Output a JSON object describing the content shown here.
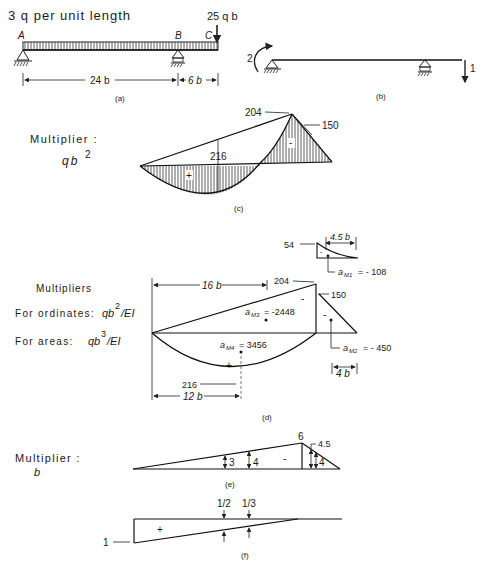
{
  "panel_a": {
    "load_label": "3 q per unit length",
    "point_load": "25 q b",
    "point_A": "A",
    "point_B": "B",
    "point_C": "C",
    "span_AB": "24 b",
    "span_BC": "6 b",
    "caption": "(a)"
  },
  "panel_b": {
    "moment_value": "2",
    "force_value": "1",
    "caption": "(b)"
  },
  "panel_c": {
    "multiplier_label": "Multiplier :",
    "multiplier_value": "qb",
    "multiplier_exp": "2",
    "ord_204": "204",
    "ord_150": "150",
    "ord_216": "216",
    "sign_plus": "+",
    "sign_minus": "-",
    "caption": "(c)"
  },
  "panel_d": {
    "multipliers_title": "Multipliers",
    "ordinates_label": "For ordinates:",
    "ordinates_value": "qb",
    "ordinates_exp": "2",
    "ordinates_tail": "/EI",
    "areas_label": "For areas:",
    "areas_value": "qb",
    "areas_exp": "3",
    "areas_tail": "/EI",
    "dim_16b": "16 b",
    "dim_12b": "12 b",
    "dim_4b": "4 b",
    "dim_4_5b": "4.5 b",
    "ord_54": "54",
    "ord_204": "204",
    "ord_150": "150",
    "ord_216": "216",
    "aM1": "a",
    "aM1_sub": "M1",
    "aM1_val": "= - 108",
    "aM2": "a",
    "aM2_sub": "M2",
    "aM2_val": "= - 450",
    "aM3": "a",
    "aM3_sub": "M3",
    "aM3_val": "= -2448",
    "aM4": "a",
    "aM4_sub": "M4",
    "aM4_val": "= 3456",
    "sign_plus": "+",
    "sign_minus": "-",
    "caption": "(d)"
  },
  "panel_e": {
    "multiplier_label": "Multiplier :",
    "multiplier_value": "b",
    "ord_6": "6",
    "ord_4_5": "4.5",
    "ord_3": "3",
    "ord_4a": "4",
    "ord_4b": "4",
    "sign_minus": "-",
    "caption": "(e)"
  },
  "panel_f": {
    "ord_1": "1",
    "ord_half": "1/2",
    "ord_third": "1/3",
    "sign_plus": "+",
    "caption": "(f)"
  }
}
